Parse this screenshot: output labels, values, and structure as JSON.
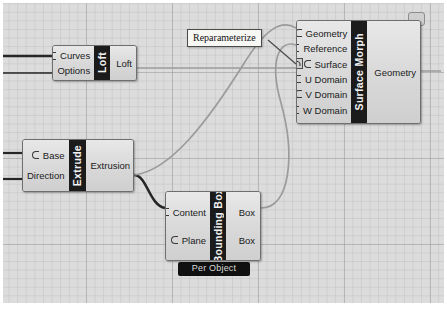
{
  "canvas": {
    "background_color": "#dcdcdc",
    "grid_color": "#a0a0a0",
    "wire_color": "#9a9a9a",
    "wire_color_strong": "#2b2b2b"
  },
  "callout": {
    "name": "reparameterize-callout",
    "label": "Reparameterize"
  },
  "nodes": [
    {
      "id": "loft",
      "name": "Loft",
      "inputs": [
        "Curves",
        "Options"
      ],
      "outputs": [
        "Loft"
      ]
    },
    {
      "id": "surface-morph",
      "name": "Surface Morph",
      "inputs": [
        "Geometry",
        "Reference",
        "Surface",
        "U Domain",
        "V Domain",
        "W Domain"
      ],
      "outputs": [
        "Geometry"
      ]
    },
    {
      "id": "extrude",
      "name": "Extrude",
      "inputs": [
        "Base",
        "Direction"
      ],
      "outputs": [
        "Extrusion"
      ]
    },
    {
      "id": "bounding-box",
      "name": "Bounding Box",
      "inputs": [
        "Content",
        "Plane"
      ],
      "outputs": [
        "Box",
        "Box"
      ],
      "message": "Per Object"
    }
  ],
  "icons": {
    "reparameterize": "arch-icon",
    "balloon": "message-balloon-icon"
  }
}
